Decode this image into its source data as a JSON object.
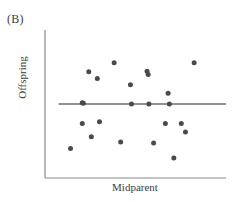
{
  "figure": {
    "panel_label": "(B)",
    "background_color": "#ffffff"
  },
  "chart_data": {
    "type": "scatter",
    "title": "",
    "panel": "(B)",
    "xlabel": "Midparent",
    "ylabel": "Offspring",
    "xlim": [
      0,
      100
    ],
    "ylim": [
      0,
      100
    ],
    "grid": false,
    "legend": null,
    "axis_ticks": {
      "x": [],
      "y": []
    },
    "point_color": "#4a4a4a",
    "point_size": 4,
    "line_color": "#6e6e6e",
    "axis_color": "#7d7d7d",
    "series": [
      {
        "name": "Offspring vs Midparent",
        "marker": "circle",
        "x": [
          20.6,
          24.2,
          28.9,
          38.2,
          56.4,
          57.0,
          68.0,
          82.4,
          47.2,
          68.7,
          20.6,
          21.2,
          30.1,
          47.8,
          57.4,
          25.6,
          66.5,
          75.3,
          77.6,
          41.8,
          60.0,
          14.1,
          71.2
        ],
        "y": [
          50.9,
          71.8,
          67.2,
          77.9,
          72.1,
          70.0,
          57.2,
          77.9,
          63.0,
          50.0,
          36.8,
          50.5,
          38.0,
          50.0,
          50.0,
          27.8,
          36.8,
          36.8,
          31.1,
          24.3,
          23.6,
          20.0,
          13.5
        ]
      }
    ],
    "regression_line": {
      "slope": 0,
      "description": "horizontal-regression-line",
      "y_value": 50.0,
      "x_start": 7.5,
      "x_end": 100.0
    }
  }
}
